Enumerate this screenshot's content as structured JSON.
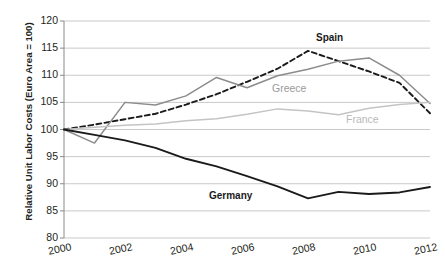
{
  "chart_data": {
    "type": "line",
    "title": "",
    "subtitle": "",
    "xlabel": "",
    "ylabel": "Relative Unit Labor Costs (Euro Area = 100)",
    "x": [
      2000,
      2001,
      2002,
      2003,
      2004,
      2005,
      2006,
      2007,
      2008,
      2009,
      2010,
      2011,
      2012
    ],
    "xlim": [
      2000,
      2012
    ],
    "ylim": [
      80,
      120
    ],
    "yticks": [
      80,
      85,
      90,
      95,
      100,
      105,
      110,
      115,
      120
    ],
    "xticks": [
      2000,
      2002,
      2004,
      2006,
      2008,
      2010,
      2012
    ],
    "grid": "horizontal",
    "legend_position": "inline-annotations",
    "series": [
      {
        "name": "Spain",
        "style": "dashed",
        "color": "#1a1a1a",
        "values": [
          100.0,
          100.9,
          101.9,
          102.9,
          104.6,
          106.5,
          108.8,
          111.2,
          114.5,
          112.6,
          110.7,
          108.6,
          103.0
        ]
      },
      {
        "name": "Greece",
        "style": "solid",
        "color": "#8c8c8c",
        "values": [
          100.0,
          97.5,
          105.0,
          104.5,
          106.2,
          109.6,
          107.7,
          109.9,
          111.1,
          112.6,
          113.2,
          110.0,
          104.8
        ]
      },
      {
        "name": "France",
        "style": "solid",
        "color": "#c4c4c4",
        "values": [
          100.0,
          100.4,
          100.8,
          101.0,
          101.6,
          102.0,
          102.8,
          103.8,
          103.4,
          102.7,
          103.9,
          104.6,
          105.0
        ]
      },
      {
        "name": "Germany",
        "style": "solid",
        "color": "#1a1a1a",
        "values": [
          100.0,
          99.0,
          98.0,
          96.6,
          94.6,
          93.2,
          91.4,
          89.5,
          87.3,
          88.5,
          88.1,
          88.4,
          89.4
        ]
      }
    ],
    "annotations": [
      {
        "text": "Spain",
        "series": "Spain",
        "color": "#1a1a1a",
        "bold": true
      },
      {
        "text": "Greece",
        "series": "Greece",
        "color": "#9a9a9a",
        "bold": false
      },
      {
        "text": "France",
        "series": "France",
        "color": "#b9b9b9",
        "bold": false
      },
      {
        "text": "Germany",
        "series": "Germany",
        "color": "#1a1a1a",
        "bold": true
      }
    ]
  },
  "axis": {
    "ytick_labels": [
      "120",
      "115",
      "110",
      "105",
      "100",
      "95",
      "90",
      "85",
      "80"
    ],
    "xtick_labels": [
      "2000",
      "2002",
      "2004",
      "2006",
      "2008",
      "2010",
      "2012"
    ],
    "ylabel_text": "Relative Unit Labor Costs (Euro Area = 100)"
  },
  "labels": {
    "spain": "Spain",
    "greece": "Greece",
    "france": "France",
    "germany": "Germany"
  },
  "colors": {
    "spain": "#1a1a1a",
    "greece": "#8c8c8c",
    "france": "#c4c4c4",
    "germany": "#1a1a1a",
    "grid": "#c9c9c9",
    "axis": "#8a8a8a",
    "text": "#231f20"
  }
}
